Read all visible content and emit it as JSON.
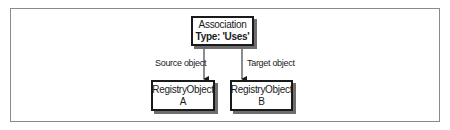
{
  "diagram": {
    "type": "uml-association",
    "nodes": [
      {
        "id": "association",
        "lines": [
          "Association",
          "Type: 'Uses'"
        ]
      },
      {
        "id": "registry-object-a",
        "lines": [
          "RegistryObject",
          "A"
        ]
      },
      {
        "id": "registry-object-b",
        "lines": [
          "RegistryObject",
          "B"
        ]
      }
    ],
    "edges": [
      {
        "from": "association",
        "to": "registry-object-a",
        "label": "Source object"
      },
      {
        "from": "association",
        "to": "registry-object-b",
        "label": "Target object"
      }
    ],
    "colors": {
      "stroke": "#1a1a1a",
      "shadow": "#6e6e6e",
      "frame": "#8a8a8a",
      "background": "#ffffff"
    }
  }
}
